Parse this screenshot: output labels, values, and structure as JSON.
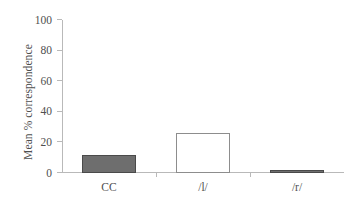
{
  "chart_data": {
    "type": "bar",
    "title": "",
    "xlabel": "",
    "ylabel": "Mean % correspondence",
    "categories": [
      "CC",
      "/l/",
      "/r/"
    ],
    "values": [
      12,
      26,
      2
    ],
    "ylim": [
      0,
      100
    ],
    "yticks": [
      0,
      20,
      40,
      60,
      80,
      100
    ],
    "ytick_labels": [
      "0",
      "20",
      "40",
      "60",
      "80",
      "100"
    ],
    "grid": false,
    "legend": null,
    "series": [
      {
        "name": "Mean % correspondence",
        "values": [
          12,
          26,
          2
        ],
        "styles": [
          "filled",
          "hollow",
          "filled"
        ]
      }
    ],
    "colors": {
      "bar_fill": "#6e6e6e",
      "bar_edge": "#4a4a4a",
      "bar_hollow_fill": "#ffffff",
      "bar_hollow_edge": "#8d8d8d",
      "axis": "#b9b9b9",
      "text": "#4f4f4f",
      "background": "#ffffff"
    }
  }
}
